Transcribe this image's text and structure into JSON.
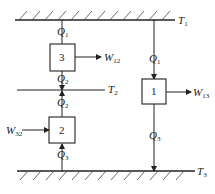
{
  "diagram": {
    "reservoirs": [
      {
        "id": "T1",
        "symbol": "T",
        "sub": "1"
      },
      {
        "id": "T2",
        "symbol": "T",
        "sub": "2"
      },
      {
        "id": "T3",
        "symbol": "T",
        "sub": "3"
      }
    ],
    "engines": [
      {
        "id": "1",
        "label": "1"
      },
      {
        "id": "2",
        "label": "2"
      },
      {
        "id": "3",
        "label": "3"
      }
    ],
    "heat_labels": {
      "q1_left": {
        "symbol": "Q",
        "sub": "1"
      },
      "q2_upper": {
        "symbol": "Q",
        "sub": "2"
      },
      "q2_lower": {
        "symbol": "Q",
        "sub": "2"
      },
      "q3_left": {
        "symbol": "Q",
        "sub": "3"
      },
      "q1_right": {
        "symbol": "Q",
        "sub": "1"
      },
      "q3_right": {
        "symbol": "Q",
        "sub": "3"
      }
    },
    "work_labels": {
      "w12": {
        "symbol": "W",
        "sub": "12"
      },
      "w13": {
        "symbol": "W",
        "sub": "13"
      },
      "w32": {
        "symbol": "W",
        "sub": "32"
      }
    }
  },
  "colors": {
    "line": "#222222",
    "hatch": "#444444",
    "background": "#ffffff"
  }
}
